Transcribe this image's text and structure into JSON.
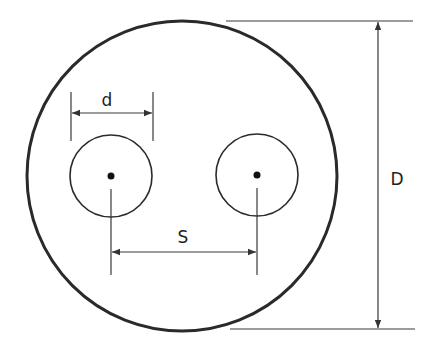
{
  "diagram": {
    "colors": {
      "background": "#ffffff",
      "outline": "#2a2a2a",
      "dimension_line": "#3a3a3a",
      "text": "#222222"
    },
    "outer_circle": {
      "cx": 182,
      "cy": 176,
      "r": 155
    },
    "conductors": [
      {
        "id": "left",
        "cx": 111,
        "cy": 176,
        "r": 41
      },
      {
        "id": "right",
        "cx": 257,
        "cy": 175,
        "r": 41
      }
    ],
    "labels": {
      "conductor_diameter": "d",
      "spacing": "S",
      "outer_diameter": "D"
    }
  }
}
